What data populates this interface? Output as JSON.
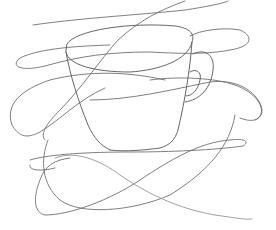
{
  "image": {
    "subject": "pencil sketch of a coffee cup on a saucer overlaid with loose scribble lines",
    "background": "#ffffff",
    "stroke_color": "#6a6a6a",
    "stroke_light": "#9a9a9a"
  }
}
